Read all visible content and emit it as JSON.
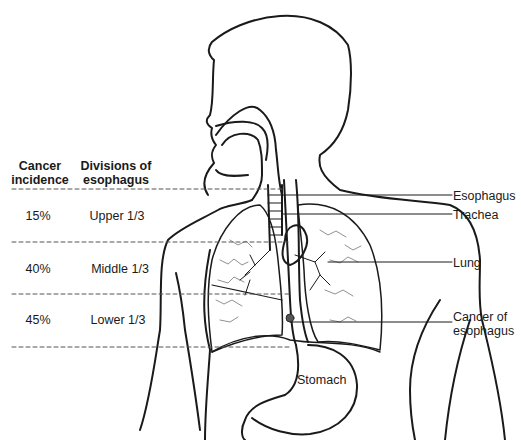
{
  "table": {
    "headers": {
      "incidence_line1": "Cancer",
      "incidence_line2": "incidence",
      "divisions_line1": "Divisions of",
      "divisions_line2": "esophagus"
    },
    "rows": [
      {
        "incidence": "15%",
        "division": "Upper 1/3"
      },
      {
        "incidence": "40%",
        "division": "Middle 1/3"
      },
      {
        "incidence": "45%",
        "division": "Lower 1/3"
      }
    ]
  },
  "labels": {
    "esophagus": "Esophagus",
    "trachea": "Trachea",
    "lung": "Lung",
    "cancer_line1": "Cancer of",
    "cancer_line2": "esophagus",
    "stomach": "Stomach"
  },
  "colors": {
    "ink": "#1a1a1a",
    "background": "#ffffff",
    "dashed": "#555555"
  }
}
